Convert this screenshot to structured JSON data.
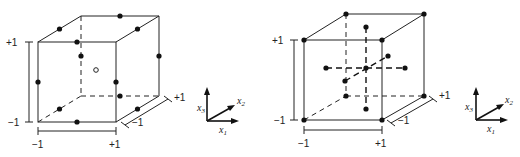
{
  "figures": [
    {
      "name": "left-cube",
      "description": "Central composite style design: edge-midpoint points plus center point",
      "tick_labels": {
        "x_min": "−1",
        "x_max": "+1",
        "z_max": "+1",
        "z_min": "−1",
        "y_min": "−1",
        "y_max": "+1"
      },
      "center_marker": "o"
    },
    {
      "name": "right-cube",
      "description": "Corner points, center point and axial (star) points",
      "tick_labels": {
        "x_min": "−1",
        "x_max": "+1",
        "z_max": "+1",
        "z_min": "−1",
        "y_min": "−1",
        "y_max": "+1"
      }
    }
  ],
  "axes_legend": {
    "x1": "x",
    "x1_sub": "1",
    "x2": "x",
    "x2_sub": "2",
    "x3": "x",
    "x3_sub": "3"
  },
  "colors": {
    "ink": "#222222",
    "background": "#ffffff"
  }
}
